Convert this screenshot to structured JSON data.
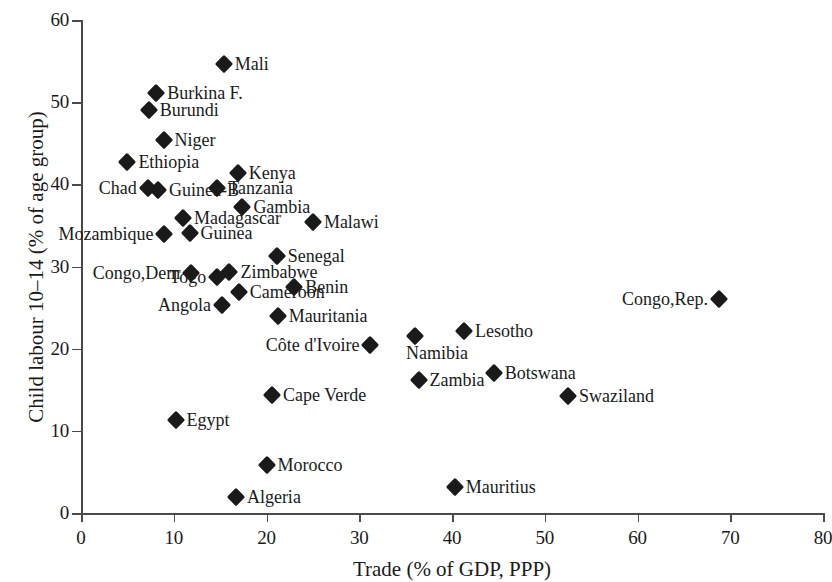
{
  "chart_data": {
    "type": "scatter",
    "title": "",
    "xlabel": "Trade (% of GDP, PPP)",
    "ylabel": "Child labour 10–14 (% of age group)",
    "xlim": [
      0,
      80
    ],
    "ylim": [
      0,
      60
    ],
    "xticks": [
      0,
      10,
      20,
      30,
      40,
      50,
      60,
      70,
      80
    ],
    "yticks": [
      0,
      10,
      20,
      30,
      40,
      50,
      60
    ],
    "grid": false,
    "legend": false,
    "marker": "filled-diamond",
    "marker_color": "#1a1a1a",
    "points": [
      {
        "label": "Mali",
        "x": 15.4,
        "y": 54.7,
        "label_side": "right"
      },
      {
        "label": "Burkina F.",
        "x": 8.1,
        "y": 51.1,
        "label_side": "right"
      },
      {
        "label": "Burundi",
        "x": 7.3,
        "y": 49.1,
        "label_side": "right"
      },
      {
        "label": "Niger",
        "x": 8.9,
        "y": 45.4,
        "label_side": "right"
      },
      {
        "label": "Ethiopia",
        "x": 5.0,
        "y": 42.7,
        "label_side": "right"
      },
      {
        "label": "Kenya",
        "x": 16.9,
        "y": 41.4,
        "label_side": "right"
      },
      {
        "label": "Chad",
        "x": 7.2,
        "y": 39.5,
        "label_side": "left"
      },
      {
        "label": "Guinea-B",
        "x": 8.3,
        "y": 39.3,
        "label_side": "right"
      },
      {
        "label": "Tanzania",
        "x": 14.7,
        "y": 39.5,
        "label_side": "right"
      },
      {
        "label": "Gambia",
        "x": 17.4,
        "y": 37.2,
        "label_side": "right"
      },
      {
        "label": "Madagascar",
        "x": 11.0,
        "y": 35.9,
        "label_side": "right"
      },
      {
        "label": "Malawi",
        "x": 25.0,
        "y": 35.4,
        "label_side": "right"
      },
      {
        "label": "Guinea",
        "x": 11.7,
        "y": 34.1,
        "label_side": "right"
      },
      {
        "label": "Mozambique",
        "x": 9.0,
        "y": 34.0,
        "label_side": "left"
      },
      {
        "label": "Senegal",
        "x": 21.1,
        "y": 31.3,
        "label_side": "right"
      },
      {
        "label": "Zimbabwe",
        "x": 16.0,
        "y": 29.3,
        "label_side": "right"
      },
      {
        "label": "Congo,Dem",
        "x": 11.9,
        "y": 29.2,
        "label_side": "left"
      },
      {
        "label": "Togo",
        "x": 14.7,
        "y": 28.7,
        "label_side": "left"
      },
      {
        "label": "Benin",
        "x": 23.0,
        "y": 27.5,
        "label_side": "right"
      },
      {
        "label": "Congo,Rep.",
        "x": 68.8,
        "y": 26.1,
        "label_side": "left"
      },
      {
        "label": "Cameroon",
        "x": 17.0,
        "y": 26.9,
        "label_side": "right"
      },
      {
        "label": "Angola",
        "x": 15.2,
        "y": 25.3,
        "label_side": "left"
      },
      {
        "label": "Mauritania",
        "x": 21.2,
        "y": 24.0,
        "label_side": "right"
      },
      {
        "label": "Lesotho",
        "x": 41.3,
        "y": 22.1,
        "label_side": "right"
      },
      {
        "label": "Namibia",
        "x": 36.0,
        "y": 21.5,
        "label_side": "below"
      },
      {
        "label": "Côte d'Ivoire",
        "x": 31.2,
        "y": 20.5,
        "label_side": "left"
      },
      {
        "label": "Botswana",
        "x": 44.5,
        "y": 17.0,
        "label_side": "right"
      },
      {
        "label": "Zambia",
        "x": 36.4,
        "y": 16.2,
        "label_side": "right"
      },
      {
        "label": "Swaziland",
        "x": 52.5,
        "y": 14.3,
        "label_side": "right"
      },
      {
        "label": "Cape Verde",
        "x": 20.6,
        "y": 14.4,
        "label_side": "right"
      },
      {
        "label": "Egypt",
        "x": 10.2,
        "y": 11.3,
        "label_side": "right"
      },
      {
        "label": "Morocco",
        "x": 20.0,
        "y": 5.9,
        "label_side": "right"
      },
      {
        "label": "Mauritius",
        "x": 40.3,
        "y": 3.2,
        "label_side": "right"
      },
      {
        "label": "Algeria",
        "x": 16.7,
        "y": 1.9,
        "label_side": "right"
      }
    ]
  }
}
